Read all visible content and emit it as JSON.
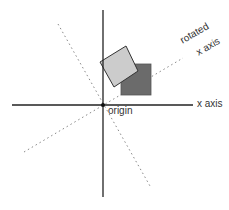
{
  "labels": {
    "x_axis": "x axis",
    "rotated_line1": "rotated",
    "rotated_line2": "x axis",
    "origin": "origin"
  },
  "colors": {
    "axis": "#222222",
    "dotted": "#888888",
    "dark_square": "#6b6b6b",
    "light_square": "#cccccc"
  }
}
